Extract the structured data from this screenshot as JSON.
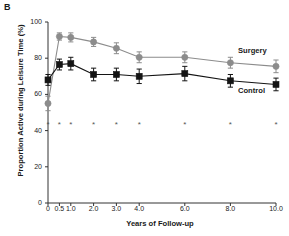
{
  "panel": {
    "label": "B"
  },
  "chart_data": {
    "type": "line",
    "title": "",
    "panel_label": "B",
    "xlabel": "Years of Follow-up",
    "ylabel": "Proportion Active during Leisure Time (%)",
    "x": [
      0,
      0.5,
      1.0,
      2.0,
      3.0,
      4.0,
      6.0,
      8.0,
      10.0
    ],
    "xtick_labels": [
      "0",
      "0.5",
      "1.0",
      "2.0",
      "3.0",
      "4.0",
      "6.0",
      "8.0",
      "10.0"
    ],
    "ytick_labels": [
      "0",
      "20",
      "40",
      "60",
      "80",
      "100"
    ],
    "yticks": [
      0,
      20,
      40,
      60,
      80,
      100
    ],
    "xlim": [
      0,
      10
    ],
    "ylim": [
      0,
      100
    ],
    "grid": false,
    "legend_position": "inline-right",
    "series": [
      {
        "name": "Surgery",
        "marker": "circle",
        "color": "#8c8c8c",
        "values": [
          55.0,
          92.0,
          91.5,
          89.0,
          85.5,
          80.5,
          80.5,
          77.5,
          75.5
        ],
        "err_low": [
          4.0,
          2.0,
          2.5,
          2.5,
          3.0,
          3.0,
          3.0,
          3.0,
          3.5
        ],
        "err_high": [
          4.0,
          2.0,
          2.5,
          2.5,
          3.0,
          3.0,
          3.0,
          3.0,
          3.5
        ]
      },
      {
        "name": "Control",
        "marker": "square",
        "color": "#141414",
        "values": [
          68.0,
          76.5,
          77.0,
          71.0,
          71.0,
          70.0,
          71.5,
          67.5,
          65.5
        ],
        "err_low": [
          3.0,
          3.0,
          3.5,
          3.5,
          3.5,
          4.0,
          4.0,
          3.5,
          3.5
        ],
        "err_high": [
          3.0,
          3.0,
          3.5,
          3.5,
          3.5,
          4.0,
          4.0,
          3.5,
          3.5
        ]
      }
    ],
    "annotations": {
      "significance_marker": "*",
      "significance_y": 43.5,
      "significance_x": [
        0,
        0.5,
        1.0,
        2.0,
        3.0,
        4.0,
        6.0,
        8.0,
        10.0
      ]
    }
  }
}
